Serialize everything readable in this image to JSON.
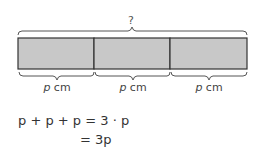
{
  "diagram": {
    "top_label": "?",
    "segments": [
      {
        "var": "p",
        "unit": "cm"
      },
      {
        "var": "p",
        "unit": "cm"
      },
      {
        "var": "p",
        "unit": "cm"
      }
    ],
    "bar_color": "#c8c8c8",
    "border_color": "#333333"
  },
  "equations": {
    "line1": "p + p + p = 3 · p",
    "line2": "= 3p"
  }
}
